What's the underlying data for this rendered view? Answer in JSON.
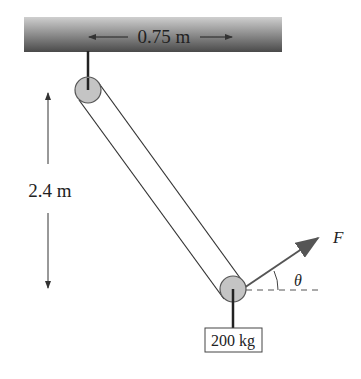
{
  "diagram": {
    "ceiling_width_label": "0.75 m",
    "height_label": "2.4 m",
    "mass_label": "200 kg",
    "force_label": "F",
    "angle_label": "θ",
    "colors": {
      "ceiling_top": "#c8c8c8",
      "ceiling_bottom": "#4a4a4a",
      "pulley_fill": "#c4c4c4",
      "line": "#333333"
    }
  }
}
